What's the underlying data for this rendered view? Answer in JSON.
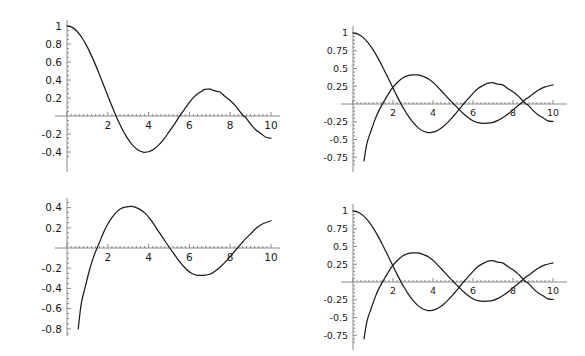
{
  "figure": {
    "background": "#ffffff",
    "curve_color": "#1c1c1c",
    "axis_color": "#8a8a8a",
    "tick_color": "#1a1a1a",
    "layout": "2x2 grid of four line plots",
    "panel_count": 4
  },
  "chart_data": [
    {
      "id": "panel-top-left",
      "type": "line",
      "title": "",
      "xlabel": "",
      "ylabel": "",
      "xlim": [
        0,
        10
      ],
      "ylim": [
        -0.45,
        1.02
      ],
      "grid": false,
      "legend": null,
      "xticks": [
        2,
        4,
        6,
        8,
        10
      ],
      "xtick_labels": [
        "2",
        "4",
        "6",
        "8",
        "10"
      ],
      "yticks": [
        1,
        0.8,
        0.6,
        0.4,
        0.2,
        -0.2,
        -0.4
      ],
      "ytick_labels": [
        "1",
        "0.8",
        "0.6",
        "0.4",
        "0.2",
        "-0.2",
        "-0.4"
      ],
      "series": [
        {
          "name": "BesselJ0",
          "x": [
            0,
            0.25,
            0.5,
            0.75,
            1,
            1.25,
            1.5,
            1.75,
            2,
            2.25,
            2.4048,
            2.5,
            2.75,
            3,
            3.25,
            3.5,
            3.75,
            3.8317,
            4,
            4.25,
            4.5,
            4.75,
            5,
            5.25,
            5.5,
            5.5201,
            5.75,
            6,
            6.25,
            6.5,
            6.75,
            7,
            7.0156,
            7.25,
            7.5,
            7.75,
            8,
            8.25,
            8.5,
            8.6537,
            8.75,
            9,
            9.25,
            9.5,
            9.75,
            10
          ],
          "y": [
            1.0,
            0.9844,
            0.9385,
            0.8642,
            0.7652,
            0.6459,
            0.5118,
            0.369,
            0.2239,
            0.0827,
            0.0,
            -0.0484,
            -0.1641,
            -0.2601,
            -0.3325,
            -0.3801,
            -0.4026,
            -0.4028,
            -0.3971,
            -0.3691,
            -0.3205,
            -0.2558,
            -0.1776,
            -0.0968,
            -0.0068,
            0.0,
            0.0711,
            0.1506,
            0.2179,
            0.2601,
            0.2951,
            0.3001,
            0.3001,
            0.2786,
            0.2663,
            0.2159,
            0.1717,
            0.1143,
            0.0419,
            0.0,
            -0.0142,
            -0.0903,
            -0.152,
            -0.1939,
            -0.2366,
            -0.2459
          ]
        }
      ]
    },
    {
      "id": "panel-top-right",
      "type": "line",
      "title": "",
      "xlabel": "",
      "ylabel": "",
      "xlim": [
        0,
        10
      ],
      "ylim": [
        -0.85,
        1.02
      ],
      "grid": false,
      "legend": null,
      "xticks": [
        2,
        4,
        6,
        8,
        10
      ],
      "xtick_labels": [
        "2",
        "4",
        "6",
        "8",
        "10"
      ],
      "yticks": [
        1,
        0.75,
        0.5,
        0.25,
        -0.25,
        -0.5,
        -0.75
      ],
      "ytick_labels": [
        "1",
        "0.75",
        "0.5",
        "0.25",
        "-0.25",
        "-0.5",
        "-0.75"
      ],
      "series": [
        {
          "name": "BesselJ0",
          "x": [
            0,
            0.25,
            0.5,
            0.75,
            1,
            1.25,
            1.5,
            1.75,
            2,
            2.25,
            2.4048,
            2.5,
            2.75,
            3,
            3.25,
            3.5,
            3.75,
            3.8317,
            4,
            4.25,
            4.5,
            4.75,
            5,
            5.25,
            5.5,
            5.5201,
            5.75,
            6,
            6.25,
            6.5,
            6.75,
            7,
            7.0156,
            7.25,
            7.5,
            7.75,
            8,
            8.25,
            8.5,
            8.6537,
            8.75,
            9,
            9.25,
            9.5,
            9.75,
            10
          ],
          "y": [
            1.0,
            0.9844,
            0.9385,
            0.8642,
            0.7652,
            0.6459,
            0.5118,
            0.369,
            0.2239,
            0.0827,
            0.0,
            -0.0484,
            -0.1641,
            -0.2601,
            -0.3325,
            -0.3801,
            -0.4026,
            -0.4028,
            -0.3971,
            -0.3691,
            -0.3205,
            -0.2558,
            -0.1776,
            -0.0968,
            -0.0068,
            0.0,
            0.0711,
            0.1506,
            0.2179,
            0.2601,
            0.2951,
            0.3001,
            0.3001,
            0.2786,
            0.2663,
            0.2159,
            0.1717,
            0.1143,
            0.0419,
            0.0,
            -0.0142,
            -0.0903,
            -0.152,
            -0.1939,
            -0.2366,
            -0.2459
          ]
        },
        {
          "name": "BesselY0",
          "x": [
            0.55,
            0.7,
            0.9,
            1.1,
            1.3,
            1.6,
            1.9,
            2.2,
            2.5,
            2.75,
            3,
            3.25,
            3.5,
            3.8,
            4.1,
            4.4,
            4.7,
            5,
            5.25,
            5.5,
            5.8,
            6.1,
            6.4,
            6.7,
            7,
            7.25,
            7.5,
            7.8,
            8.1,
            8.4,
            8.7,
            9,
            9.3,
            9.6,
            10
          ],
          "y": [
            -0.8,
            -0.55,
            -0.38,
            -0.22,
            -0.09,
            0.06,
            0.2,
            0.3,
            0.37,
            0.4,
            0.41,
            0.41,
            0.39,
            0.35,
            0.28,
            0.19,
            0.1,
            0.01,
            -0.06,
            -0.13,
            -0.2,
            -0.25,
            -0.27,
            -0.27,
            -0.26,
            -0.23,
            -0.19,
            -0.13,
            -0.06,
            0.01,
            0.08,
            0.14,
            0.2,
            0.24,
            0.27
          ]
        }
      ]
    },
    {
      "id": "panel-bottom-left",
      "type": "line",
      "title": "",
      "xlabel": "",
      "ylabel": "",
      "xlim": [
        0,
        10
      ],
      "ylim": [
        -0.85,
        0.47
      ],
      "grid": false,
      "legend": null,
      "xticks": [
        2,
        4,
        6,
        8,
        10
      ],
      "xtick_labels": [
        "2",
        "4",
        "6",
        "8",
        "10"
      ],
      "yticks": [
        0.4,
        0.2,
        -0.2,
        -0.4,
        -0.6,
        -0.8
      ],
      "ytick_labels": [
        "0.4",
        "0.2",
        "-0.2",
        "-0.4",
        "-0.6",
        "-0.8"
      ],
      "series": [
        {
          "name": "BesselY0",
          "x": [
            0.55,
            0.7,
            0.9,
            1.1,
            1.3,
            1.6,
            1.9,
            2.2,
            2.5,
            2.75,
            3,
            3.25,
            3.5,
            3.8,
            4.1,
            4.4,
            4.7,
            5,
            5.25,
            5.5,
            5.8,
            6.1,
            6.4,
            6.7,
            7,
            7.25,
            7.5,
            7.8,
            8.1,
            8.4,
            8.7,
            9,
            9.3,
            9.6,
            10
          ],
          "y": [
            -0.8,
            -0.55,
            -0.38,
            -0.22,
            -0.09,
            0.06,
            0.2,
            0.3,
            0.37,
            0.4,
            0.41,
            0.41,
            0.39,
            0.35,
            0.28,
            0.19,
            0.1,
            0.01,
            -0.06,
            -0.13,
            -0.2,
            -0.25,
            -0.27,
            -0.27,
            -0.26,
            -0.23,
            -0.19,
            -0.13,
            -0.06,
            0.01,
            0.08,
            0.14,
            0.2,
            0.24,
            0.27
          ]
        }
      ]
    },
    {
      "id": "panel-bottom-right",
      "type": "line",
      "title": "",
      "xlabel": "",
      "ylabel": "",
      "xlim": [
        0,
        10
      ],
      "ylim": [
        -0.85,
        1.02
      ],
      "grid": false,
      "legend": null,
      "xticks": [
        2,
        4,
        6,
        8,
        10
      ],
      "xtick_labels": [
        "2",
        "4",
        "6",
        "8",
        "10"
      ],
      "yticks": [
        1,
        0.75,
        0.5,
        0.25,
        -0.25,
        -0.5,
        -0.75
      ],
      "ytick_labels": [
        "1",
        "0.75",
        "0.5",
        "0.25",
        "-0.25",
        "-0.5",
        "-0.75"
      ],
      "series": [
        {
          "name": "BesselJ0",
          "x": [
            0,
            0.25,
            0.5,
            0.75,
            1,
            1.25,
            1.5,
            1.75,
            2,
            2.25,
            2.4048,
            2.5,
            2.75,
            3,
            3.25,
            3.5,
            3.75,
            3.8317,
            4,
            4.25,
            4.5,
            4.75,
            5,
            5.25,
            5.5,
            5.5201,
            5.75,
            6,
            6.25,
            6.5,
            6.75,
            7,
            7.0156,
            7.25,
            7.5,
            7.75,
            8,
            8.25,
            8.5,
            8.6537,
            8.75,
            9,
            9.25,
            9.5,
            9.75,
            10
          ],
          "y": [
            1.0,
            0.9844,
            0.9385,
            0.8642,
            0.7652,
            0.6459,
            0.5118,
            0.369,
            0.2239,
            0.0827,
            0.0,
            -0.0484,
            -0.1641,
            -0.2601,
            -0.3325,
            -0.3801,
            -0.4026,
            -0.4028,
            -0.3971,
            -0.3691,
            -0.3205,
            -0.2558,
            -0.1776,
            -0.0968,
            -0.0068,
            0.0,
            0.0711,
            0.1506,
            0.2179,
            0.2601,
            0.2951,
            0.3001,
            0.3001,
            0.2786,
            0.2663,
            0.2159,
            0.1717,
            0.1143,
            0.0419,
            0.0,
            -0.0142,
            -0.0903,
            -0.152,
            -0.1939,
            -0.2366,
            -0.2459
          ]
        },
        {
          "name": "BesselY0",
          "x": [
            0.55,
            0.7,
            0.9,
            1.1,
            1.3,
            1.6,
            1.9,
            2.2,
            2.5,
            2.75,
            3,
            3.25,
            3.5,
            3.8,
            4.1,
            4.4,
            4.7,
            5,
            5.25,
            5.5,
            5.8,
            6.1,
            6.4,
            6.7,
            7,
            7.25,
            7.5,
            7.8,
            8.1,
            8.4,
            8.7,
            9,
            9.3,
            9.6,
            10
          ],
          "y": [
            -0.8,
            -0.55,
            -0.38,
            -0.22,
            -0.09,
            0.06,
            0.2,
            0.3,
            0.37,
            0.4,
            0.41,
            0.41,
            0.39,
            0.35,
            0.28,
            0.19,
            0.1,
            0.01,
            -0.06,
            -0.13,
            -0.2,
            -0.25,
            -0.27,
            -0.27,
            -0.26,
            -0.23,
            -0.19,
            -0.13,
            -0.06,
            0.01,
            0.08,
            0.14,
            0.2,
            0.24,
            0.27
          ]
        }
      ]
    }
  ],
  "panels": [
    {
      "name": "panel-top-left",
      "left": 0,
      "top": 0,
      "width": 292,
      "height": 178,
      "origin_x": 67,
      "origin_y": 116,
      "x_scale": 20.4,
      "y_scale": 90,
      "axis_x_end": 280,
      "axis_y_top": 20,
      "axis_y_bottom": 172,
      "font_size": 10.5
    },
    {
      "name": "panel-top-right",
      "left": 292,
      "top": 0,
      "width": 293,
      "height": 178,
      "origin_x": 61,
      "origin_y": 104,
      "x_scale": 20.0,
      "y_scale": 71,
      "axis_x_end": 275,
      "axis_y_top": 26,
      "axis_y_bottom": 172,
      "font_size": 9.5
    },
    {
      "name": "panel-bottom-left",
      "left": 0,
      "top": 178,
      "width": 292,
      "height": 178,
      "origin_x": 67,
      "origin_y": 70,
      "x_scale": 20.4,
      "y_scale": 101,
      "axis_x_end": 280,
      "axis_y_top": 20,
      "axis_y_bottom": 158,
      "font_size": 10.5
    },
    {
      "name": "panel-bottom-right",
      "left": 292,
      "top": 178,
      "width": 293,
      "height": 178,
      "origin_x": 61,
      "origin_y": 104,
      "x_scale": 20.0,
      "y_scale": 71,
      "axis_x_end": 275,
      "axis_y_top": 26,
      "axis_y_bottom": 172,
      "font_size": 9.5
    }
  ]
}
